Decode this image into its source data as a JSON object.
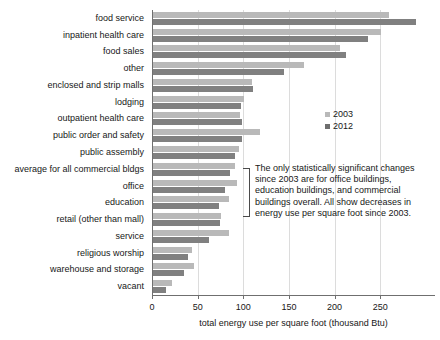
{
  "chart_data": {
    "type": "bar",
    "orientation": "horizontal",
    "title": "",
    "xlabel": "total energy use per square foot (thousand Btu)",
    "ylabel": "",
    "xlim": [
      0,
      310
    ],
    "xticks": [
      0,
      50,
      100,
      150,
      200,
      250
    ],
    "grid": true,
    "legend_position": "middle-right",
    "categories": [
      "food service",
      "inpatient health care",
      "food sales",
      "other",
      "enclosed and strip malls",
      "lodging",
      "outpatient health care",
      "public order and safety",
      "public assembly",
      "average for all commercial bldgs",
      "office",
      "education",
      "retail (other than mall)",
      "service",
      "religious worship",
      "warehouse and storage",
      "vacant"
    ],
    "series": [
      {
        "name": "2003",
        "color": "#b9b9b9",
        "values": [
          258,
          250,
          205,
          165,
          108,
          100,
          95,
          117,
          94,
          90,
          92,
          83,
          74,
          83,
          43,
          45,
          21
        ]
      },
      {
        "name": "2012",
        "color": "#808080",
        "values": [
          288,
          235,
          211,
          144,
          110,
          96,
          98,
          97,
          90,
          84,
          79,
          72,
          73,
          61,
          38,
          34,
          14
        ]
      }
    ],
    "annotations": [
      {
        "text": "The only statistically significant changes since 2003 are for office buildings, education buildings, and commercial buildings overall. All show decreases in energy use per square foot since 2003.",
        "bracket_categories": [
          "average for all commercial bldgs",
          "office",
          "education"
        ]
      }
    ]
  },
  "legend": {
    "items": [
      {
        "label": "2003",
        "color": "#b9b9b9"
      },
      {
        "label": "2012",
        "color": "#6e6e6e"
      }
    ]
  }
}
